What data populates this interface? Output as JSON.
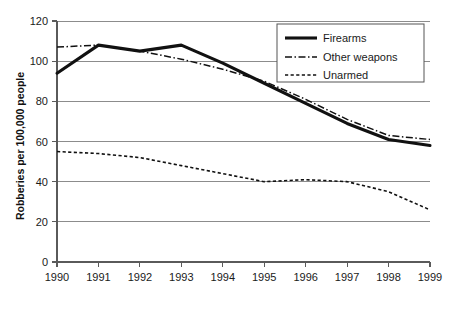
{
  "chart_data": {
    "type": "line",
    "title": "",
    "xlabel": "",
    "ylabel": "Robberies per 100,000 people",
    "x": [
      1990,
      1991,
      1992,
      1993,
      1994,
      1995,
      1996,
      1997,
      1998,
      1999
    ],
    "xticklabels": [
      "1990",
      "1991",
      "1992",
      "1993",
      "1994",
      "1995",
      "1996",
      "1997",
      "1998",
      "1999"
    ],
    "yticklabels": [
      "0",
      "20",
      "40",
      "60",
      "80",
      "100",
      "120"
    ],
    "yticks": [
      0,
      20,
      40,
      60,
      80,
      100,
      120
    ],
    "ylim": [
      0,
      120
    ],
    "xlim": [
      1990,
      1999
    ],
    "grid": "horizontal",
    "legend_position": "top-right",
    "series": [
      {
        "name": "Firearms",
        "style": "solid-thick",
        "values": [
          94,
          108,
          105,
          108,
          99,
          89,
          79,
          69,
          61,
          58
        ]
      },
      {
        "name": "Other weapons",
        "style": "dash-dot",
        "values": [
          107,
          108,
          105,
          101,
          96,
          90,
          81,
          71,
          63,
          61
        ]
      },
      {
        "name": "Unarmed",
        "style": "dashed",
        "values": [
          55,
          54,
          52,
          48,
          44,
          40,
          41,
          40,
          35,
          26
        ]
      }
    ]
  },
  "legend": {
    "items": [
      {
        "label": "Firearms"
      },
      {
        "label": "Other weapons"
      },
      {
        "label": "Unarmed"
      }
    ]
  }
}
